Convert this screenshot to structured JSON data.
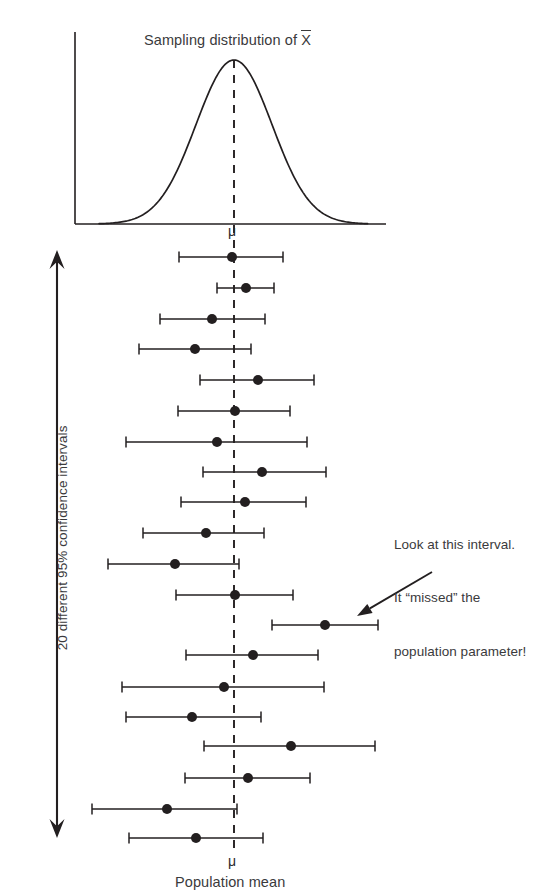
{
  "figure": {
    "width": 558,
    "height": 896,
    "background": "#ffffff",
    "ink_color": "#231f20",
    "text_color": "#3a3a3c"
  },
  "chart_title": "Sampling distribution of ",
  "chart_title_symbol": "X",
  "mu_symbol_top": "μ",
  "mu_symbol_bottom": "μ",
  "x_axis_label": "Population mean",
  "vertical_axis_label": "20 different 95% confidence intervals",
  "annotation": {
    "line1": "Look at this interval.",
    "line2": "It “missed” the",
    "line3": "population parameter!"
  },
  "chart_data": {
    "type": "scatter",
    "subtitle": "20 different 95% confidence intervals",
    "xlabel": "Population mean",
    "ylabel": "20 different 95% confidence intervals",
    "grid": false,
    "legend": null,
    "annotations": [
      {
        "text": "Look at this interval. It “missed” the population parameter!",
        "points_to_interval": 13,
        "arrow_from_px": [
          432,
          572
        ],
        "arrow_to_px": [
          357,
          616
        ]
      }
    ],
    "population_mean_label": "μ",
    "population_mean_px_x": 234,
    "top_panel": {
      "type": "line",
      "description": "normal sampling distribution curve of the sample mean",
      "curve": "gaussian",
      "peak_px": [
        234,
        60
      ],
      "baseline_px_y": 224,
      "left_axis_px_x": 75,
      "right_axis_end_px_x": 386,
      "sigma_px": 38,
      "dashed_center_line": true
    },
    "confidence_level": "95%",
    "n_intervals": 20,
    "n_missed": 1,
    "units": "pixels (horizontal position encodes sample mean)",
    "intervals": [
      {
        "i": 1,
        "y": 257,
        "lower": 179,
        "center": 232,
        "upper": 283,
        "covers_mu": true
      },
      {
        "i": 2,
        "y": 288,
        "lower": 217,
        "center": 246,
        "upper": 274,
        "covers_mu": true
      },
      {
        "i": 3,
        "y": 319,
        "lower": 160,
        "center": 212,
        "upper": 265,
        "covers_mu": true
      },
      {
        "i": 4,
        "y": 349,
        "lower": 139,
        "center": 195,
        "upper": 251,
        "covers_mu": true
      },
      {
        "i": 5,
        "y": 380,
        "lower": 200,
        "center": 258,
        "upper": 314,
        "covers_mu": true
      },
      {
        "i": 6,
        "y": 411,
        "lower": 178,
        "center": 235,
        "upper": 290,
        "covers_mu": true
      },
      {
        "i": 7,
        "y": 442,
        "lower": 126,
        "center": 217,
        "upper": 307,
        "covers_mu": true
      },
      {
        "i": 8,
        "y": 472,
        "lower": 203,
        "center": 262,
        "upper": 326,
        "covers_mu": true
      },
      {
        "i": 9,
        "y": 502,
        "lower": 181,
        "center": 245,
        "upper": 306,
        "covers_mu": true
      },
      {
        "i": 10,
        "y": 533,
        "lower": 143,
        "center": 206,
        "upper": 264,
        "covers_mu": true
      },
      {
        "i": 11,
        "y": 564,
        "lower": 108,
        "center": 175,
        "upper": 239,
        "covers_mu": true
      },
      {
        "i": 12,
        "y": 595,
        "lower": 176,
        "center": 235,
        "upper": 293,
        "covers_mu": true
      },
      {
        "i": 13,
        "y": 625,
        "lower": 272,
        "center": 325,
        "upper": 378,
        "covers_mu": false
      },
      {
        "i": 14,
        "y": 655,
        "lower": 186,
        "center": 253,
        "upper": 318,
        "covers_mu": true
      },
      {
        "i": 15,
        "y": 687,
        "lower": 122,
        "center": 224,
        "upper": 324,
        "covers_mu": true
      },
      {
        "i": 16,
        "y": 717,
        "lower": 126,
        "center": 192,
        "upper": 261,
        "covers_mu": true
      },
      {
        "i": 17,
        "y": 746,
        "lower": 204,
        "center": 291,
        "upper": 375,
        "covers_mu": true
      },
      {
        "i": 18,
        "y": 778,
        "lower": 185,
        "center": 248,
        "upper": 310,
        "covers_mu": true
      },
      {
        "i": 19,
        "y": 809,
        "lower": 92,
        "center": 167,
        "upper": 237,
        "covers_mu": true
      },
      {
        "i": 20,
        "y": 838,
        "lower": 129,
        "center": 196,
        "upper": 263,
        "covers_mu": true
      }
    ],
    "vertical_span_arrow": {
      "x": 57,
      "y_top": 250,
      "y_bottom": 838,
      "double_headed": true
    }
  }
}
